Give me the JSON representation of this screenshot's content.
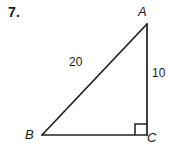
{
  "problem": {
    "number": "7."
  },
  "figure": {
    "type": "right-triangle",
    "stroke_color": "#231f20",
    "background_color": "#ffffff",
    "vertices": [
      {
        "name": "A",
        "label": "A",
        "x": 147,
        "y": 24
      },
      {
        "name": "B",
        "label": "B",
        "x": 42,
        "y": 135
      },
      {
        "name": "C",
        "label": "C",
        "x": 147,
        "y": 135
      }
    ],
    "sides": [
      {
        "name": "AB",
        "label": "20",
        "kind": "hypotenuse"
      },
      {
        "name": "AC",
        "label": "10",
        "kind": "leg"
      },
      {
        "name": "BC",
        "label": "",
        "kind": "leg"
      }
    ],
    "right_angle": {
      "at_vertex": "C",
      "marker": "square",
      "size": 11
    }
  }
}
